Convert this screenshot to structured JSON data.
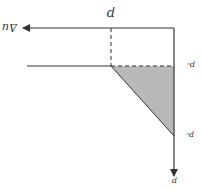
{
  "diagram": {
    "orientation": "rotated-180",
    "labels": {
      "top_axis": "Δu",
      "top_marker": "p",
      "upper_right": "pₑ",
      "lower_right": "pₛ",
      "bottom_axis": "p"
    },
    "colors": {
      "line": "#333333",
      "fill": "#b8b8b8"
    }
  }
}
